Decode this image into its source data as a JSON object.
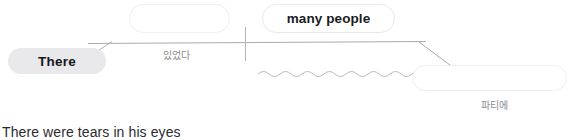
{
  "diagram": {
    "nodes": [
      {
        "id": "blank",
        "label": "",
        "kind": "bubble-empty"
      },
      {
        "id": "many-people",
        "label": "many people",
        "kind": "bubble"
      },
      {
        "id": "there",
        "label": "There",
        "kind": "chip"
      },
      {
        "id": "party",
        "label": "",
        "kind": "bubble-empty"
      }
    ],
    "annotations": [
      {
        "id": "itseotda",
        "text": "있었다"
      },
      {
        "id": "patie",
        "text": "파티에"
      }
    ],
    "colors": {
      "chip_background": "#e9e9ec",
      "bubble_border": "#e9e9ec",
      "line": "#aaaab0",
      "wavy_line": "#b9b9c0",
      "label_text": "#8c8c93",
      "primary_text": "#1b1b1d",
      "sentence_text": "#2b2b2e",
      "page_background": "#ffffff"
    }
  },
  "sentence": {
    "text": "There were tears in his eyes"
  }
}
